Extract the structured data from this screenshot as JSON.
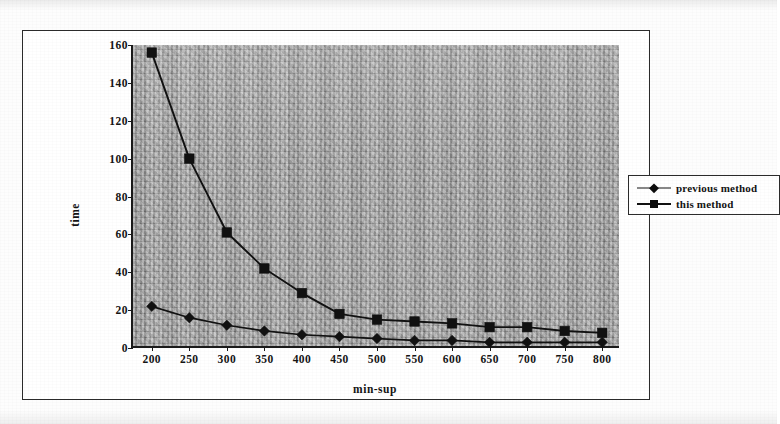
{
  "chart_data": {
    "type": "line",
    "title": "",
    "xlabel": "min-sup",
    "ylabel": "time",
    "categories": [
      200,
      250,
      300,
      350,
      400,
      450,
      500,
      550,
      600,
      650,
      700,
      750,
      800
    ],
    "x_tick_labels": [
      "200",
      "250",
      "300",
      "350",
      "400",
      "450",
      "500",
      "550",
      "600",
      "650",
      "700",
      "750",
      "800"
    ],
    "y_tick_labels": [
      "0",
      "20",
      "40",
      "60",
      "80",
      "100",
      "120",
      "140",
      "160"
    ],
    "y_ticks": [
      0,
      20,
      40,
      60,
      80,
      100,
      120,
      140,
      160
    ],
    "ylim": [
      0,
      160
    ],
    "grid": false,
    "legend_position": "right-outside",
    "series": [
      {
        "name": "previous method",
        "marker": "diamond",
        "color": "#111111",
        "values": [
          22,
          16,
          12,
          9,
          7,
          6,
          5,
          4,
          4,
          3,
          3,
          3,
          3
        ]
      },
      {
        "name": "this method",
        "marker": "square",
        "color": "#111111",
        "values": [
          156,
          100,
          61,
          42,
          29,
          18,
          15,
          14,
          13,
          11,
          11,
          9,
          8
        ]
      }
    ]
  },
  "legend": {
    "entries": [
      {
        "label": "previous method",
        "marker": "diamond-marker-icon"
      },
      {
        "label": "this method",
        "marker": "square-marker-icon"
      }
    ]
  },
  "colors": {
    "plot_background": "#a9a9a9",
    "axis": "#1a1a1a",
    "frame": "#2a2a2a",
    "series": "#111111",
    "page_background": "#ffffff"
  }
}
